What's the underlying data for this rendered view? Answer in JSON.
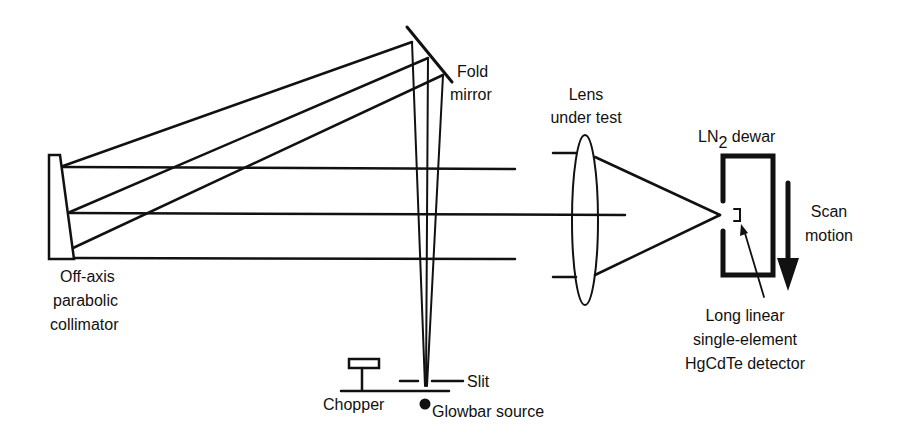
{
  "diagram": {
    "labels": {
      "collimator": [
        "Off-axis",
        "parabolic",
        "collimator"
      ],
      "fold_mirror": [
        "Fold",
        "mirror"
      ],
      "lens": [
        "Lens",
        "under test"
      ],
      "dewar_prefix": "LN",
      "dewar_subscript": "2",
      "dewar_suffix": " dewar",
      "scan": [
        "Scan",
        "motion"
      ],
      "detector": [
        "Long linear",
        "single-element",
        "HgCdTe detector"
      ],
      "slit": "Slit",
      "chopper": "Chopper",
      "source": "Glowbar source"
    },
    "components": [
      "Off-axis parabolic collimator",
      "Fold mirror",
      "Lens under test",
      "LN2 dewar",
      "Long linear single-element HgCdTe detector",
      "Slit",
      "Chopper",
      "Glowbar source"
    ],
    "colors": {
      "line": "#111111",
      "background": "#ffffff"
    }
  }
}
